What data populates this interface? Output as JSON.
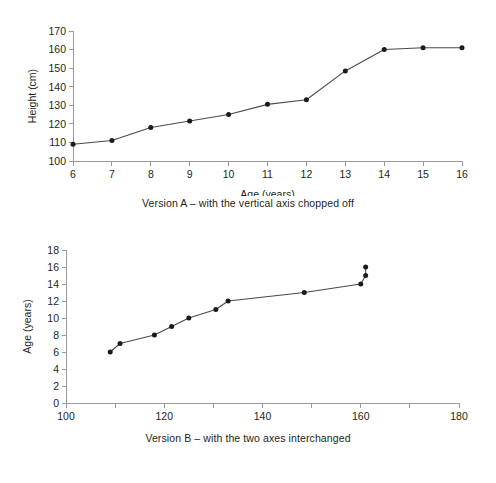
{
  "figures": [
    {
      "id": "version-a",
      "caption": "Version A – with the vertical axis chopped off"
    },
    {
      "id": "version-b",
      "caption": "Version B – with the two axes interchanged"
    }
  ],
  "chart_data": [
    {
      "type": "line",
      "title": "",
      "xlabel": "Age (years)",
      "ylabel": "Height (cm)",
      "xlim": [
        6,
        16
      ],
      "ylim": [
        100,
        170
      ],
      "xticks": [
        6,
        7,
        8,
        9,
        10,
        11,
        12,
        13,
        14,
        15,
        16
      ],
      "yticks": [
        100,
        110,
        120,
        130,
        140,
        150,
        160,
        170
      ],
      "xticklabels": [
        "6",
        "7",
        "8",
        "9",
        "10",
        "11",
        "12",
        "13",
        "14",
        "15",
        "16"
      ],
      "yticklabels": [
        "100",
        "110",
        "120",
        "130",
        "140",
        "150",
        "160",
        "170"
      ],
      "grid": false,
      "legend": "none",
      "markers": "filled-circle",
      "x": [
        6,
        7,
        8,
        9,
        10,
        11,
        12,
        13,
        14,
        15,
        16
      ],
      "values": [
        109,
        111,
        118,
        121.5,
        125,
        130.5,
        133,
        148.5,
        160,
        161,
        161
      ],
      "caption": "Version A – with the vertical axis chopped off"
    },
    {
      "type": "line",
      "title": "",
      "xlabel": "Height (cm)",
      "ylabel": "Age (years)",
      "xlim": [
        100,
        180
      ],
      "ylim": [
        0,
        18
      ],
      "xticks": [
        100,
        110,
        120,
        130,
        140,
        150,
        160,
        170,
        180
      ],
      "xticklabels": [
        "100",
        "",
        "120",
        "",
        "140",
        "",
        "160",
        "",
        "180"
      ],
      "xticks_labeled": [
        100,
        120,
        140,
        160,
        180
      ],
      "yticks": [
        0,
        2,
        4,
        6,
        8,
        10,
        12,
        14,
        16,
        18
      ],
      "yticklabels": [
        "0",
        "2",
        "4",
        "6",
        "8",
        "10",
        "12",
        "14",
        "16",
        "18"
      ],
      "grid": false,
      "legend": "none",
      "markers": "filled-circle",
      "x": [
        109,
        111,
        118,
        121.5,
        125,
        130.5,
        133,
        148.5,
        160,
        161,
        161
      ],
      "values": [
        6,
        7,
        8,
        9,
        10,
        11,
        12,
        13,
        14,
        15,
        16
      ],
      "caption": "Version B – with the two axes interchanged"
    }
  ],
  "colors": {
    "axis": "#9a9a9a",
    "line": "#4a4a4a",
    "marker": "#1b1b1b",
    "text": "#231f20",
    "background": "#ffffff"
  }
}
